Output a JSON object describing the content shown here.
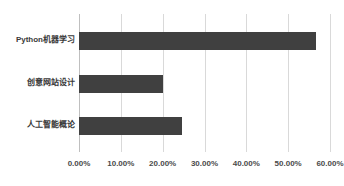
{
  "chart_data": {
    "type": "bar",
    "orientation": "horizontal",
    "title": "",
    "subtitle": "",
    "xlabel": "",
    "ylabel": "",
    "categories": [
      "Python机器学习",
      "创意网站设计",
      "人工智能概论"
    ],
    "values": [
      56.7,
      20.0,
      24.6
    ],
    "value_format": "percent",
    "xlim": [
      0,
      60
    ],
    "ylim": null,
    "x_ticks": [
      0,
      10,
      20,
      30,
      40,
      50,
      60
    ],
    "x_tick_labels": [
      "0.00%",
      "10.00%",
      "20.00%",
      "30.00%",
      "40.00%",
      "50.00%",
      "60.00%"
    ],
    "grid": true,
    "grid_axis": "x",
    "legend": false,
    "legend_position": "none",
    "series": [
      {
        "name": "",
        "values": [
          56.7,
          20.0,
          24.6
        ]
      }
    ]
  },
  "style": {
    "background_color": "#ffffff",
    "bar_color": "#404040",
    "gridline_color": "#d9d9d9",
    "axis_color": "#bfbfbf",
    "label_color": "#3a3a3a",
    "tick_label_color": "#4a4a4a"
  }
}
